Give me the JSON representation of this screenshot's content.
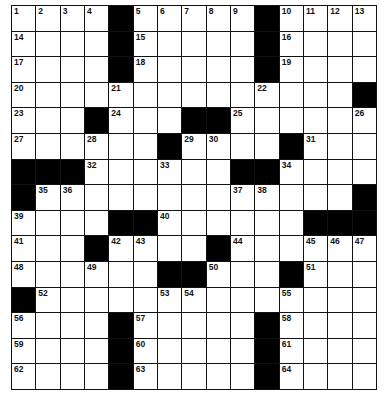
{
  "puzzle": {
    "rows": 15,
    "cols": 15,
    "layout": [
      "1234#56789#ABCD",
      "....#.....#....",
      "....#.....#....",
      "..............#",
      "...#...##......",
      "......#....#...",
      "###......##....",
      "#.............#",
      "....##......###",
      "...#....#......",
      "......##...#...",
      "#..............",
      "....#.....#....",
      "....#.....#....",
      "....#.....#...."
    ],
    "numbers": [
      [
        0,
        0,
        1
      ],
      [
        0,
        1,
        2
      ],
      [
        0,
        2,
        3
      ],
      [
        0,
        3,
        4
      ],
      [
        0,
        5,
        5
      ],
      [
        0,
        6,
        6
      ],
      [
        0,
        7,
        7
      ],
      [
        0,
        8,
        8
      ],
      [
        0,
        9,
        9
      ],
      [
        0,
        11,
        10
      ],
      [
        0,
        12,
        11
      ],
      [
        0,
        13,
        12
      ],
      [
        0,
        14,
        13
      ],
      [
        1,
        0,
        14
      ],
      [
        1,
        5,
        15
      ],
      [
        1,
        11,
        16
      ],
      [
        2,
        0,
        17
      ],
      [
        2,
        5,
        18
      ],
      [
        2,
        11,
        19
      ],
      [
        3,
        0,
        20
      ],
      [
        3,
        4,
        21
      ],
      [
        3,
        10,
        22
      ],
      [
        4,
        0,
        23
      ],
      [
        4,
        4,
        24
      ],
      [
        4,
        9,
        25
      ],
      [
        4,
        14,
        26
      ],
      [
        5,
        0,
        27
      ],
      [
        5,
        3,
        28
      ],
      [
        5,
        7,
        29
      ],
      [
        5,
        8,
        30
      ],
      [
        5,
        12,
        31
      ],
      [
        6,
        3,
        32
      ],
      [
        6,
        6,
        33
      ],
      [
        6,
        11,
        34
      ],
      [
        7,
        1,
        35
      ],
      [
        7,
        2,
        36
      ],
      [
        7,
        9,
        37
      ],
      [
        7,
        10,
        38
      ],
      [
        8,
        0,
        39
      ],
      [
        8,
        6,
        40
      ],
      [
        9,
        0,
        41
      ],
      [
        9,
        4,
        42
      ],
      [
        9,
        5,
        43
      ],
      [
        9,
        9,
        44
      ],
      [
        9,
        12,
        45
      ],
      [
        9,
        13,
        46
      ],
      [
        9,
        14,
        47
      ],
      [
        10,
        0,
        48
      ],
      [
        10,
        3,
        49
      ],
      [
        10,
        8,
        50
      ],
      [
        10,
        12,
        51
      ],
      [
        11,
        1,
        52
      ],
      [
        11,
        6,
        53
      ],
      [
        11,
        7,
        54
      ],
      [
        11,
        11,
        55
      ],
      [
        12,
        0,
        56
      ],
      [
        12,
        5,
        57
      ],
      [
        12,
        11,
        58
      ],
      [
        13,
        0,
        59
      ],
      [
        13,
        5,
        60
      ],
      [
        13,
        11,
        61
      ],
      [
        14,
        0,
        62
      ],
      [
        14,
        5,
        63
      ],
      [
        14,
        11,
        64
      ]
    ],
    "colors": {
      "block": "#000000",
      "cell": "#ffffff",
      "line": "#111111"
    }
  }
}
